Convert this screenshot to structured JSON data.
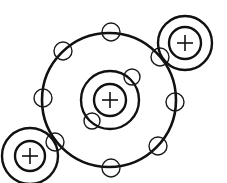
{
  "diagram": {
    "title": "",
    "colors": {
      "stroke": "#111111",
      "background": "#ffffff"
    },
    "central_atom": {
      "nucleus": {
        "cx": 110,
        "cy": 100,
        "r": 16,
        "symbol": "+"
      },
      "inner_shell": {
        "cx": 110,
        "cy": 100,
        "r": 29,
        "electrons": [
          {
            "cx": 132,
            "cy": 77
          },
          {
            "cx": 92,
            "cy": 121
          }
        ]
      },
      "outer_shell": {
        "cx": 109,
        "cy": 100,
        "r": 67,
        "electrons": [
          {
            "cx": 111,
            "cy": 32
          },
          {
            "cx": 63,
            "cy": 51
          },
          {
            "cx": 43,
            "cy": 98
          },
          {
            "cx": 55,
            "cy": 142
          },
          {
            "cx": 111,
            "cy": 168
          },
          {
            "cx": 158,
            "cy": 146
          },
          {
            "cx": 175,
            "cy": 102
          },
          {
            "cx": 160,
            "cy": 57
          }
        ]
      }
    },
    "bonded_atoms": [
      {
        "name": "top-right-atom",
        "cx": 185,
        "cy": 43,
        "nucleus_r": 16,
        "shell_r": 27,
        "symbol": "+"
      },
      {
        "name": "bottom-left-atom",
        "cx": 30,
        "cy": 156,
        "nucleus_r": 15,
        "shell_r": 28,
        "symbol": "+"
      }
    ],
    "electron_radius": 9
  }
}
